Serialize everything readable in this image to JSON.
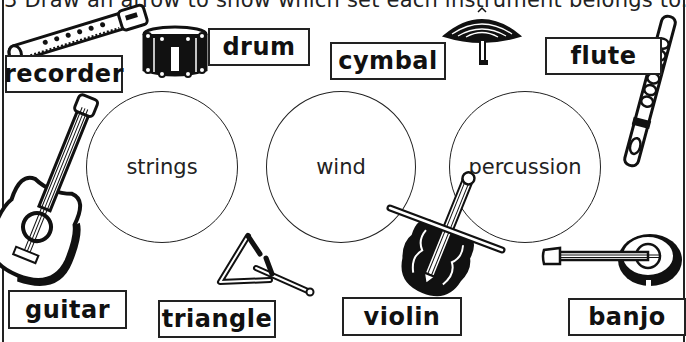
{
  "worksheet": {
    "instruction": "3  Draw an arrow to show which set each instrument belongs to.",
    "sets": [
      {
        "id": "strings",
        "label": "strings"
      },
      {
        "id": "wind",
        "label": "wind"
      },
      {
        "id": "percussion",
        "label": "percussion"
      }
    ],
    "instruments": [
      {
        "id": "recorder",
        "label": "recorder",
        "icon": "recorder-icon"
      },
      {
        "id": "drum",
        "label": "drum",
        "icon": "drum-icon"
      },
      {
        "id": "cymbal",
        "label": "cymbal",
        "icon": "cymbal-icon"
      },
      {
        "id": "flute",
        "label": "flute",
        "icon": "flute-icon"
      },
      {
        "id": "guitar",
        "label": "guitar",
        "icon": "guitar-icon"
      },
      {
        "id": "triangle",
        "label": "triangle",
        "icon": "triangle-icon"
      },
      {
        "id": "violin",
        "label": "violin",
        "icon": "violin-icon"
      },
      {
        "id": "banjo",
        "label": "banjo",
        "icon": "banjo-icon"
      }
    ],
    "colors": {
      "ink": "#111111",
      "paper": "#ffffff"
    }
  }
}
